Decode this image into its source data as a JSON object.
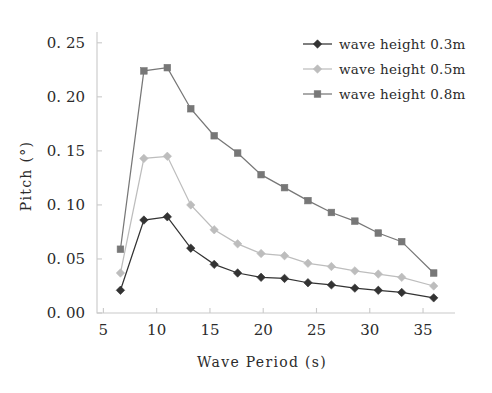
{
  "chart_data": {
    "type": "line",
    "title": "",
    "xlabel": "Wave Period (s)",
    "ylabel": "Pitch (°)",
    "xlim": [
      4.4,
      38.0
    ],
    "ylim": [
      0.0,
      0.26
    ],
    "grid": false,
    "legend_position": "top-right",
    "xticks": [
      5,
      10,
      15,
      20,
      25,
      30,
      35
    ],
    "xtick_labels": [
      "5",
      "10",
      "15",
      "20",
      "25",
      "30",
      "35"
    ],
    "yticks": [
      0.0,
      0.05,
      0.1,
      0.15,
      0.2,
      0.25
    ],
    "ytick_labels": [
      "0. 00",
      "0. 05",
      "0. 10",
      "0. 15",
      "0. 20",
      "0. 25"
    ],
    "x": [
      6.6,
      8.8,
      11.0,
      13.2,
      15.4,
      17.6,
      19.8,
      22.0,
      24.2,
      26.4,
      28.6,
      30.8,
      33.0,
      36.0
    ],
    "series": [
      {
        "name": "wave height 0.3m",
        "color": "#333333",
        "marker": "diamond",
        "values": [
          0.021,
          0.086,
          0.089,
          0.06,
          0.045,
          0.037,
          0.033,
          0.032,
          0.028,
          0.026,
          0.023,
          0.021,
          0.019,
          0.014
        ]
      },
      {
        "name": "wave height 0.5m",
        "color": "#bdbdbd",
        "marker": "diamond",
        "values": [
          0.037,
          0.143,
          0.145,
          0.1,
          0.077,
          0.064,
          0.055,
          0.053,
          0.046,
          0.043,
          0.039,
          0.036,
          0.033,
          0.025
        ]
      },
      {
        "name": "wave height 0.8m",
        "color": "#777777",
        "marker": "square",
        "values": [
          0.059,
          0.224,
          0.227,
          0.189,
          0.164,
          0.148,
          0.128,
          0.116,
          0.104,
          0.093,
          0.085,
          0.074,
          0.066,
          0.037
        ]
      }
    ]
  },
  "legend": {
    "entries": [
      {
        "label": "wave height 0.3m"
      },
      {
        "label": "wave height 0.5m"
      },
      {
        "label": "wave height 0.8m"
      }
    ]
  },
  "axes": {
    "x_title": "Wave Period (s)",
    "y_title": "Pitch (°)"
  }
}
